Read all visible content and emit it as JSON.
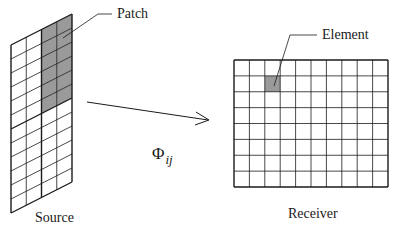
{
  "labels": {
    "patch": "Patch",
    "element": "Element",
    "source": "Source",
    "receiver": "Receiver",
    "form_factor_symbol": "Φ",
    "form_factor_subscript": "ij"
  },
  "source": {
    "columns": 4,
    "rows": 12,
    "patch_cols": [
      2,
      3
    ],
    "patch_rows": [
      0,
      1,
      2,
      3,
      4,
      5
    ],
    "corners": {
      "tl": [
        11,
        45
      ],
      "tr": [
        72,
        14
      ],
      "bl": [
        11,
        213
      ],
      "br": [
        72,
        182
      ]
    }
  },
  "receiver": {
    "columns": 10,
    "rows": 8,
    "element": {
      "col": 2,
      "row": 1
    },
    "bounds": {
      "x": 234,
      "y": 60,
      "width": 154,
      "height": 127
    }
  },
  "colors": {
    "line": "#1a1a1a",
    "shade": "#9a9a9a",
    "background": "#ffffff"
  }
}
